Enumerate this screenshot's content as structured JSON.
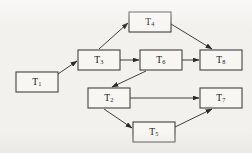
{
  "figure": {
    "kind": "task-precedence-directed-acyclic-graph",
    "background_color": "#f2f1ee",
    "node_fill_color": "#f7f6f3",
    "node_stroke_color": "#3a3a3a",
    "edge_color": "#2b2b2b",
    "label_color": "#1a1a1a",
    "width": 252,
    "height": 153
  },
  "nodes": [
    {
      "id": "T1",
      "base": "T",
      "sub": "1",
      "label": "T1",
      "x": 16,
      "y": 72,
      "w": 42,
      "h": 20
    },
    {
      "id": "T3",
      "base": "T",
      "sub": "3",
      "label": "T3",
      "x": 78,
      "y": 50,
      "w": 42,
      "h": 20
    },
    {
      "id": "T4",
      "base": "T",
      "sub": "4",
      "label": "T4",
      "x": 129,
      "y": 12,
      "w": 42,
      "h": 20
    },
    {
      "id": "T6",
      "base": "T",
      "sub": "6",
      "label": "T6",
      "x": 140,
      "y": 50,
      "w": 42,
      "h": 20
    },
    {
      "id": "T8",
      "base": "T",
      "sub": "8",
      "label": "T8",
      "x": 200,
      "y": 50,
      "w": 42,
      "h": 20
    },
    {
      "id": "T2",
      "base": "T",
      "sub": "2",
      "label": "T2",
      "x": 88,
      "y": 88,
      "w": 42,
      "h": 20
    },
    {
      "id": "T7",
      "base": "T",
      "sub": "7",
      "label": "T7",
      "x": 200,
      "y": 88,
      "w": 42,
      "h": 20
    },
    {
      "id": "T5",
      "base": "T",
      "sub": "5",
      "label": "T5",
      "x": 133,
      "y": 122,
      "w": 42,
      "h": 20
    }
  ],
  "edges": [
    {
      "id": "e-t1-t3",
      "from": "T1",
      "to": "T3",
      "x1": 58,
      "y1": 74,
      "x2": 77,
      "y2": 61
    },
    {
      "id": "e-t3-t4",
      "from": "T3",
      "to": "T4",
      "x1": 99,
      "y1": 49,
      "x2": 128,
      "y2": 23
    },
    {
      "id": "e-t3-t6",
      "from": "T3",
      "to": "T6",
      "x1": 120,
      "y1": 60,
      "x2": 139,
      "y2": 60
    },
    {
      "id": "e-t4-t8",
      "from": "T4",
      "to": "T8",
      "x1": 171,
      "y1": 24,
      "x2": 212,
      "y2": 49
    },
    {
      "id": "e-t6-t8",
      "from": "T6",
      "to": "T8",
      "x1": 182,
      "y1": 60,
      "x2": 199,
      "y2": 60
    },
    {
      "id": "e-t6-t2",
      "from": "T6",
      "to": "T2",
      "x1": 146,
      "y1": 71,
      "x2": 112,
      "y2": 87
    },
    {
      "id": "e-t2-t7",
      "from": "T2",
      "to": "T7",
      "x1": 130,
      "y1": 98,
      "x2": 199,
      "y2": 98
    },
    {
      "id": "e-t2-t5",
      "from": "T2",
      "to": "T5",
      "x1": 104,
      "y1": 109,
      "x2": 132,
      "y2": 128
    },
    {
      "id": "e-t5-t7",
      "from": "T5",
      "to": "T7",
      "x1": 175,
      "y1": 127,
      "x2": 212,
      "y2": 109
    }
  ]
}
